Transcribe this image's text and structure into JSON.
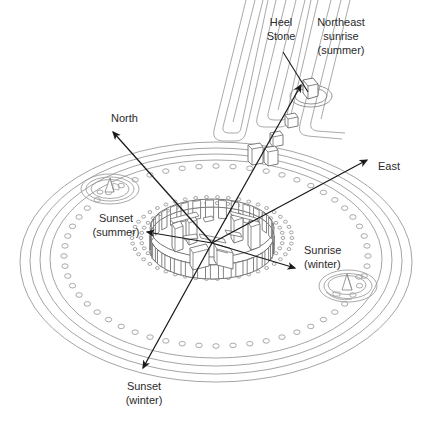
{
  "figure": {
    "background_color": "#ffffff",
    "line_color": "#8a8a8a",
    "structure_line_color": "#6e6e6e",
    "arrow_color": "#1a1a1a",
    "text_color": "#2a2a2a"
  },
  "labels": {
    "heel_stone": {
      "line1": "Heel",
      "line2": "Stone"
    },
    "northeast_sunrise": {
      "line1": "Northeast",
      "line2": "sunrise",
      "line3": "(summer)"
    },
    "north": {
      "line1": "North"
    },
    "east": {
      "line1": "East"
    },
    "sunset_summer": {
      "line1": "Sunset",
      "line2": "(summer)"
    },
    "sunrise_winter": {
      "line1": "Sunrise",
      "line2": "(winter)"
    },
    "sunset_winter": {
      "line1": "Sunset",
      "line2": "(winter)"
    }
  },
  "features": {
    "outer_bank": "outer-bank-ring",
    "ditch": "ditch-ring",
    "aubrey_holes": "aubrey-holes-ring",
    "aubrey_hole_count": 56,
    "y_z_holes": "y-and-z-holes-ring",
    "sarsen_circle": "sarsen-stone-circle",
    "sarsen_stone_count": 30,
    "trilithon_horseshoe": "trilithon-horseshoe",
    "north_barrow": "north-barrow",
    "south_barrow": "south-barrow",
    "avenue": "the-avenue",
    "slaughter_stone": "slaughter-stone",
    "heel_stone_marker": "heel-stone"
  },
  "chart_data": {
    "type": "diagram",
    "center": {
      "x": 212,
      "y": 243
    },
    "alignments": [
      {
        "name": "North",
        "tip_x": 113,
        "tip_y": 132,
        "label_x": 112,
        "label_y": 118
      },
      {
        "name": "Northeast sunrise (summer)",
        "tip_x": 301,
        "tip_y": 85,
        "label_x": 290,
        "label_y": 30
      },
      {
        "name": "East",
        "tip_x": 367,
        "tip_y": 160,
        "label_x": 379,
        "label_y": 166
      },
      {
        "name": "Sunrise (winter)",
        "tip_x": 295,
        "tip_y": 268,
        "label_x": 302,
        "label_y": 250
      },
      {
        "name": "Sunset (summer)",
        "tip_x": 147,
        "tip_y": 232,
        "label_x": 82,
        "label_y": 216
      },
      {
        "name": "Sunset (winter)",
        "tip_x": 143,
        "tip_y": 368,
        "label_x": 108,
        "label_y": 383
      }
    ]
  }
}
